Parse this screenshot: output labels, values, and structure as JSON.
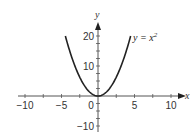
{
  "chart_data": {
    "type": "line",
    "title": "",
    "xlabel": "x",
    "ylabel": "y",
    "xlim": [
      -10,
      10
    ],
    "ylim": [
      -10,
      20
    ],
    "x_ticks": [
      -10,
      -5,
      0,
      5,
      10
    ],
    "x_tick_labels": [
      "−10",
      "−5",
      "0",
      "5",
      "10"
    ],
    "y_ticks": [
      -10,
      10,
      20
    ],
    "y_tick_labels": [
      "−10",
      "10",
      "20"
    ],
    "minor_tick_step": 2.5,
    "grid": false,
    "legend": "none",
    "series": [
      {
        "name": "y = x²",
        "function": "x^2",
        "x_range": [
          -4.47,
          4.47
        ],
        "x": [
          -4.47,
          -4,
          -3,
          -2,
          -1,
          0,
          1,
          2,
          3,
          4,
          4.47
        ],
        "y": [
          20,
          16,
          9,
          4,
          1,
          0,
          1,
          4,
          9,
          16,
          20
        ]
      }
    ],
    "annotations": [
      {
        "text": "y = x²",
        "position": "right of curve top"
      }
    ]
  },
  "labels": {
    "x_axis": "x",
    "y_axis": "y",
    "curve_base": "y = x",
    "curve_exp": "2"
  },
  "colors": {
    "curve": "#222222",
    "axes": "#555555",
    "text": "#333333"
  }
}
